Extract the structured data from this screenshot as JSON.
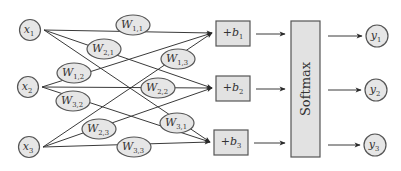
{
  "diagram": {
    "colors": {
      "node_fill": "#e6e6e6",
      "stroke": "#555555",
      "edge": "#3a3a3a",
      "text": "#333333"
    },
    "inputs": [
      {
        "id": "x1",
        "base": "x",
        "sub": "1",
        "cx": 30,
        "cy": 30
      },
      {
        "id": "x2",
        "base": "x",
        "sub": "2",
        "cx": 28,
        "cy": 87
      },
      {
        "id": "x3",
        "base": "x",
        "sub": "3",
        "cx": 29,
        "cy": 147
      }
    ],
    "weights": [
      {
        "id": "W11",
        "base": "W",
        "sub": "1,1",
        "cx": 133,
        "cy": 25
      },
      {
        "id": "W21",
        "base": "W",
        "sub": "2,1",
        "cx": 104,
        "cy": 49
      },
      {
        "id": "W12",
        "base": "W",
        "sub": "1,2",
        "cx": 74,
        "cy": 73
      },
      {
        "id": "W13",
        "base": "W",
        "sub": "1,3",
        "cx": 178,
        "cy": 59
      },
      {
        "id": "W22",
        "base": "W",
        "sub": "2,2",
        "cx": 158,
        "cy": 88
      },
      {
        "id": "W32",
        "base": "W",
        "sub": "3,2",
        "cx": 73,
        "cy": 101
      },
      {
        "id": "W31",
        "base": "W",
        "sub": "3,1",
        "cx": 177,
        "cy": 123
      },
      {
        "id": "W23",
        "base": "W",
        "sub": "2,3",
        "cx": 99,
        "cy": 129
      },
      {
        "id": "W33",
        "base": "W",
        "sub": "3,3",
        "cx": 134,
        "cy": 147
      }
    ],
    "biases": [
      {
        "id": "b1",
        "prefix": "+",
        "base": "b",
        "sub": "1",
        "x": 216,
        "y": 21
      },
      {
        "id": "b2",
        "prefix": "+",
        "base": "b",
        "sub": "2",
        "x": 216,
        "y": 76
      },
      {
        "id": "b3",
        "prefix": "+",
        "base": "b",
        "sub": "3",
        "x": 214,
        "y": 130
      }
    ],
    "softmax": {
      "label": "Softmax",
      "x": 291,
      "y": 21,
      "w": 29,
      "h": 136
    },
    "outputs": [
      {
        "id": "y1",
        "base": "y",
        "sub": "1",
        "cx": 377,
        "cy": 36
      },
      {
        "id": "y2",
        "base": "y",
        "sub": "2",
        "cx": 376,
        "cy": 90
      },
      {
        "id": "y3",
        "base": "y",
        "sub": "3",
        "cx": 375,
        "cy": 145
      }
    ],
    "edges": [
      {
        "from": "x1",
        "to": "b1",
        "via": "W11"
      },
      {
        "from": "x1",
        "to": "b2",
        "via": "W21"
      },
      {
        "from": "x1",
        "to": "b3",
        "via": "W31"
      },
      {
        "from": "x2",
        "to": "b1",
        "via": "W12"
      },
      {
        "from": "x2",
        "to": "b2",
        "via": "W22"
      },
      {
        "from": "x2",
        "to": "b3",
        "via": "W32"
      },
      {
        "from": "x3",
        "to": "b1",
        "via": "W13"
      },
      {
        "from": "x3",
        "to": "b2",
        "via": "W23"
      },
      {
        "from": "x3",
        "to": "b3",
        "via": "W33"
      }
    ]
  }
}
